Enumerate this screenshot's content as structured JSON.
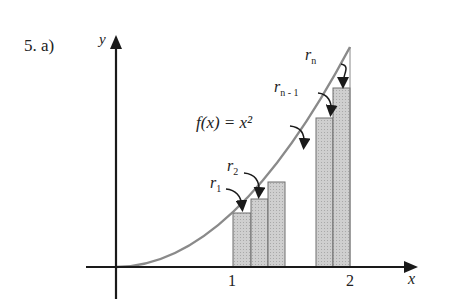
{
  "problem_label": "5.  a)",
  "axes": {
    "x_label": "x",
    "y_label": "y",
    "ticks": [
      "1",
      "2"
    ]
  },
  "function_label": "f(x) = x²",
  "rect_labels": {
    "r1": {
      "base": "r",
      "sub": "1"
    },
    "r2": {
      "base": "r",
      "sub": "2"
    },
    "rn1": {
      "base": "r",
      "sub": "n - 1"
    },
    "rn": {
      "base": "r",
      "sub": "n"
    }
  },
  "colors": {
    "curve": "#8a8a8a",
    "rect_fill": "#c8c8c8",
    "axis": "#1a1a1a"
  }
}
